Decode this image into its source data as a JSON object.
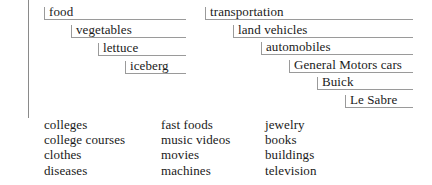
{
  "figure": {
    "background_color": "#ffffff",
    "text_color": "#1a1a1a",
    "rule_color": "#9a9a9a",
    "spine_color": "#8a8a8a"
  },
  "spine": {
    "name": "left-vertical-rule"
  },
  "hierarchies": [
    {
      "name": "food-hierarchy",
      "levels": [
        {
          "label": "food",
          "indent": 0,
          "depth": 0
        },
        {
          "label": "vegetables",
          "indent": 1,
          "depth": 1
        },
        {
          "label": "lettuce",
          "indent": 2,
          "depth": 2
        },
        {
          "label": "iceberg",
          "indent": 3,
          "depth": 3
        }
      ]
    },
    {
      "name": "transportation-hierarchy",
      "levels": [
        {
          "label": "transportation",
          "indent": 0,
          "depth": 0
        },
        {
          "label": "land vehicles",
          "indent": 1,
          "depth": 1
        },
        {
          "label": "automobiles",
          "indent": 2,
          "depth": 2
        },
        {
          "label": "General Motors cars",
          "indent": 3,
          "depth": 3
        },
        {
          "label": "Buick",
          "indent": 4,
          "depth": 4
        },
        {
          "label": "Le Sabre",
          "indent": 5,
          "depth": 5
        }
      ]
    }
  ],
  "word_columns": [
    {
      "name": "word-column-1",
      "words": [
        "colleges",
        "college courses",
        "clothes",
        "diseases"
      ]
    },
    {
      "name": "word-column-2",
      "words": [
        "fast foods",
        "music videos",
        "movies",
        "machines"
      ]
    },
    {
      "name": "word-column-3",
      "words": [
        "jewelry",
        "books",
        "buildings",
        "television"
      ]
    }
  ]
}
